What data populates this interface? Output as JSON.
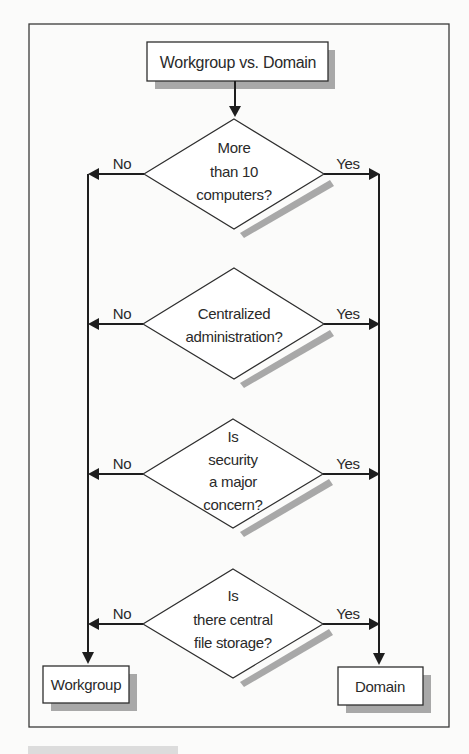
{
  "diagram": {
    "type": "flowchart",
    "title_box": {
      "label": "Workgroup vs. Domain"
    },
    "decisions": [
      {
        "lines": [
          "More",
          "than 10",
          "computers?"
        ],
        "no_label": "No",
        "yes_label": "Yes"
      },
      {
        "lines": [
          "Centralized",
          "administration?"
        ],
        "no_label": "No",
        "yes_label": "Yes"
      },
      {
        "lines": [
          "Is",
          "security",
          "a major",
          "concern?"
        ],
        "no_label": "No",
        "yes_label": "Yes"
      },
      {
        "lines": [
          "Is",
          "there central",
          "file storage?"
        ],
        "no_label": "No",
        "yes_label": "Yes"
      }
    ],
    "outcomes": {
      "no": {
        "label": "Workgroup"
      },
      "yes": {
        "label": "Domain"
      }
    },
    "flow": {
      "start": "title_box",
      "sequence": [
        "decision-1",
        "decision-2",
        "decision-3",
        "decision-4"
      ],
      "no_branch_target": "outcomes.no",
      "yes_branch_target": "outcomes.yes"
    },
    "colors": {
      "line": "#1e1e1e",
      "shadow": "#a8a8a8",
      "box_fill": "#ffffff",
      "text": "#2a2a2a"
    }
  }
}
